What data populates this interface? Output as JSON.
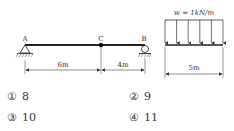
{
  "diagram": {
    "beam": {
      "labels": {
        "a": "A",
        "c": "C",
        "b": "B"
      },
      "dimensions": {
        "ac": "6m",
        "cb": "4m"
      }
    },
    "load": {
      "label": "w = 1kN/m",
      "span": "5m",
      "arrow_count": 6
    }
  },
  "options": [
    {
      "marker": "①",
      "value": "8"
    },
    {
      "marker": "②",
      "value": "9"
    },
    {
      "marker": "③",
      "value": "10"
    },
    {
      "marker": "④",
      "value": "11"
    }
  ]
}
